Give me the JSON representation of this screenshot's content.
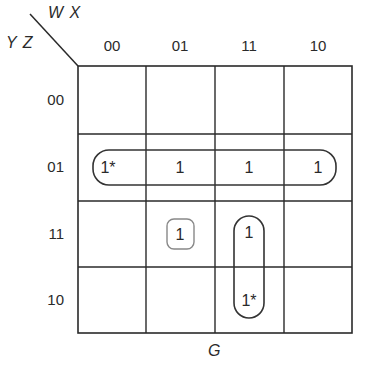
{
  "kmap": {
    "row_variables": "Y Z",
    "col_variables": "W X",
    "function_label": "G",
    "col_labels": [
      "00",
      "01",
      "11",
      "10"
    ],
    "row_labels": [
      "00",
      "01",
      "11",
      "10"
    ],
    "cells": [
      [
        "",
        "",
        "",
        ""
      ],
      [
        "1*",
        "1",
        "1",
        "1"
      ],
      [
        "",
        "1",
        "1",
        ""
      ],
      [
        "",
        "",
        "1*",
        ""
      ]
    ],
    "groupings": [
      {
        "name": "row-01-quad",
        "cells": [
          [
            1,
            0
          ],
          [
            1,
            1
          ],
          [
            1,
            2
          ],
          [
            1,
            3
          ]
        ],
        "essential": true
      },
      {
        "name": "col-11-pair",
        "cells": [
          [
            2,
            2
          ],
          [
            3,
            2
          ]
        ],
        "essential": true
      },
      {
        "name": "single-cell",
        "cells": [
          [
            2,
            1
          ]
        ],
        "essential": false
      }
    ],
    "colors": {
      "line": "#2a2a2a",
      "group_line": "#333333",
      "single_group_line": "#888888",
      "background": "#ffffff"
    }
  }
}
